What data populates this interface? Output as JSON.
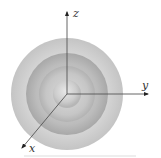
{
  "diagram": {
    "type": "concentric-spheres-with-3d-axes",
    "center": {
      "x": 67,
      "y": 94
    },
    "spheres": [
      {
        "radius": 56,
        "color_edge": "#c8c8c8",
        "color_center": "#e4e4e4"
      },
      {
        "radius": 41,
        "color_edge": "#a9a9a9",
        "color_center": "#cfcfcf"
      },
      {
        "radius": 28,
        "color_edge": "#b0b0b0",
        "color_center": "#d8d8d8"
      },
      {
        "radius": 14,
        "color_edge": "#b8b8b8",
        "color_center": "#dedede"
      }
    ],
    "axes": {
      "z": {
        "label": "z",
        "x2": 67,
        "y2": 12
      },
      "y": {
        "label": "y",
        "x2": 148,
        "y2": 94
      },
      "x": {
        "label": "x",
        "x2": 22,
        "y2": 148
      }
    },
    "axis_color": "#444444",
    "baseline_color": "#d9d9d9"
  }
}
